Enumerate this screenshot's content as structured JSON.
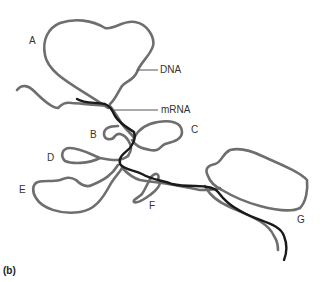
{
  "figure": {
    "panel_label": "(b)",
    "labels": {
      "A": "A",
      "B": "B",
      "C": "C",
      "D": "D",
      "E": "E",
      "F": "F",
      "G": "G",
      "dna": "DNA",
      "mrna": "mRNA"
    },
    "colors": {
      "dna_strand": "#6e6e6e",
      "mrna_strand": "#1a1a1a",
      "background": "#ffffff"
    }
  }
}
